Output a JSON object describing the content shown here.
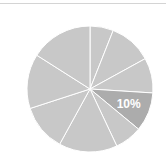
{
  "chart_data": {
    "type": "pie",
    "title": "",
    "start_angle_deg": 0,
    "direction": "clockwise",
    "slices": [
      {
        "label": "",
        "value": 6,
        "color": "#c8c8c8",
        "show_label": false
      },
      {
        "label": "",
        "value": 11,
        "color": "#c8c8c8",
        "show_label": false
      },
      {
        "label": "",
        "value": 9,
        "color": "#c8c8c8",
        "show_label": false
      },
      {
        "label": "10%",
        "value": 10,
        "color": "#acacac",
        "show_label": true,
        "highlighted": true
      },
      {
        "label": "",
        "value": 7,
        "color": "#c8c8c8",
        "show_label": false
      },
      {
        "label": "",
        "value": 15,
        "color": "#c8c8c8",
        "show_label": false
      },
      {
        "label": "",
        "value": 12,
        "color": "#c8c8c8",
        "show_label": false
      },
      {
        "label": "",
        "value": 14,
        "color": "#c8c8c8",
        "show_label": false
      },
      {
        "label": "",
        "value": 16,
        "color": "#c8c8c8",
        "show_label": false
      }
    ],
    "data_labels": [
      "10%"
    ],
    "legend": null,
    "slice_border_color": "#ffffff"
  },
  "colors": {
    "slice_default": "#c8c8c8",
    "slice_highlight": "#acacac",
    "label_text": "#ffffff",
    "top_rule": "#d4d4d4"
  }
}
